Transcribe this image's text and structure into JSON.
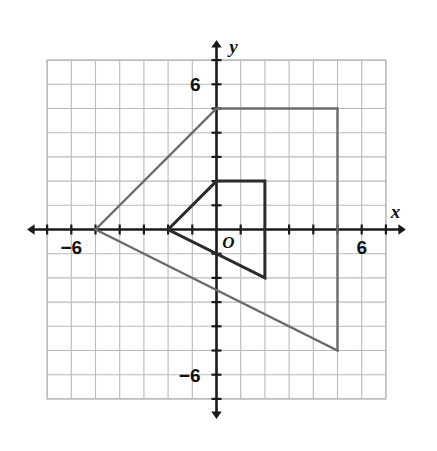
{
  "figure": {
    "kind": "coordinate-plane-dilation",
    "background_color": "#ffffff",
    "grid_color": "#b9b9c0",
    "axis_color": "#1a1a1a",
    "preimage_color": "#6b6b6b",
    "image_color": "#2b2b2b"
  },
  "axes": {
    "x_label": "x",
    "y_label": "y",
    "origin_label": "O",
    "x_tick_labels": [
      {
        "text": "−6",
        "value": -6
      },
      {
        "text": "6",
        "value": 6
      }
    ],
    "y_tick_labels": [
      {
        "text": "6",
        "value": 6
      },
      {
        "text": "−6",
        "value": -6
      }
    ],
    "x_range": [
      -7,
      7
    ],
    "y_range": [
      -7,
      7
    ],
    "tick_step": 1,
    "grid": true,
    "arrows": [
      "left",
      "right",
      "up",
      "down"
    ]
  },
  "chart_data": {
    "type": "scatter",
    "title": "",
    "xlabel": "x",
    "ylabel": "y",
    "xlim": [
      -7,
      7
    ],
    "ylim": [
      -7,
      7
    ],
    "grid": true,
    "legend": "none",
    "series": [
      {
        "name": "preimage",
        "shape": "quadrilateral",
        "color": "#6b6b6b",
        "closed": true,
        "points": [
          [
            -5,
            0
          ],
          [
            0,
            5
          ],
          [
            5,
            5
          ],
          [
            5,
            -5
          ]
        ]
      },
      {
        "name": "image",
        "shape": "quadrilateral",
        "color": "#2b2b2b",
        "closed": true,
        "points": [
          [
            -2,
            0
          ],
          [
            0,
            2
          ],
          [
            2,
            2
          ],
          [
            2,
            -2
          ]
        ]
      }
    ]
  }
}
